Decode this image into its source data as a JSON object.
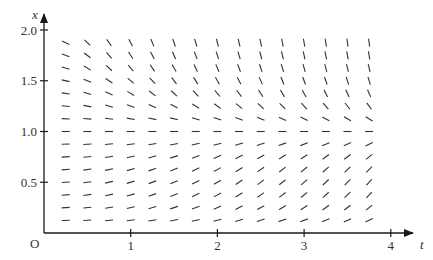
{
  "chart_data": {
    "type": "slope_field",
    "title": "",
    "xlabel": "t",
    "ylabel": "x",
    "origin_label": "O",
    "xlim": [
      0,
      4.3
    ],
    "ylim": [
      0,
      2.05
    ],
    "x_ticks": [
      1,
      2,
      3,
      4
    ],
    "x_tick_labels": [
      "1",
      "2",
      "3",
      "4"
    ],
    "y_ticks": [
      0.5,
      1.0,
      1.5,
      2.0
    ],
    "y_tick_labels": [
      "0.5",
      "1.0",
      "1.5",
      "2.0"
    ],
    "grid": false,
    "legend": null,
    "field": {
      "description": "Slope field consistent with dx/dt = t·x·(1−x): flat at x=1, negative above, positive below, steepening with t",
      "t_values": [
        0.25,
        0.5,
        0.75,
        1.0,
        1.25,
        1.5,
        1.75,
        2.0,
        2.25,
        2.5,
        2.75,
        3.0,
        3.25,
        3.5,
        3.75
      ],
      "x_values": [
        0.125,
        0.25,
        0.375,
        0.5,
        0.625,
        0.75,
        0.875,
        1.0,
        1.125,
        1.25,
        1.375,
        1.5,
        1.625,
        1.75,
        1.875
      ]
    }
  },
  "colors": {
    "axis": "#1a1a1a",
    "segment": "#333333",
    "text": "#333333"
  }
}
